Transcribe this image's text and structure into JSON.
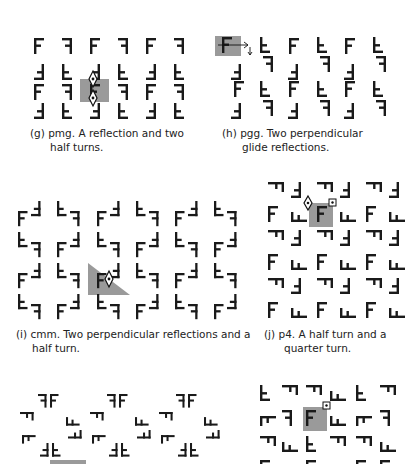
{
  "colors": {
    "glyph": "#1a1a1a",
    "highlight": "#9a9a9a",
    "background": "#ffffff"
  },
  "panels": [
    {
      "id": "g",
      "label": "(g)",
      "caption_line1": "pmg.  A reflection and two",
      "caption_line2": "half turns.",
      "group": "pmg",
      "symmetry_markers": [
        "half-turn-center",
        "half-turn-center",
        "reflection-axis"
      ]
    },
    {
      "id": "h",
      "label": "(h)",
      "caption_line1": "pgg.  Two perpendicular",
      "caption_line2": "glide reflections.",
      "group": "pgg",
      "symmetry_markers": [
        "glide-reflection-arrow",
        "glide-reflection-arrow"
      ]
    },
    {
      "id": "i",
      "label": "(i)",
      "caption_line1": "cmm.  Two perpendicular reflections and a",
      "caption_line2": "half turn.",
      "group": "cmm",
      "symmetry_markers": [
        "half-turn-center",
        "triangular-fundamental-region"
      ]
    },
    {
      "id": "j",
      "label": "(j)",
      "caption_line1": "p4.  A half turn and a",
      "caption_line2": "quarter turn.",
      "group": "p4",
      "symmetry_markers": [
        "half-turn-center",
        "quarter-turn-center"
      ]
    },
    {
      "id": "k",
      "label": "",
      "caption_line1": "",
      "caption_line2": "",
      "group": "partial",
      "symmetry_markers": []
    },
    {
      "id": "l",
      "label": "",
      "caption_line1": "",
      "caption_line2": "",
      "group": "partial",
      "symmetry_markers": [
        "quarter-turn-center"
      ]
    }
  ]
}
